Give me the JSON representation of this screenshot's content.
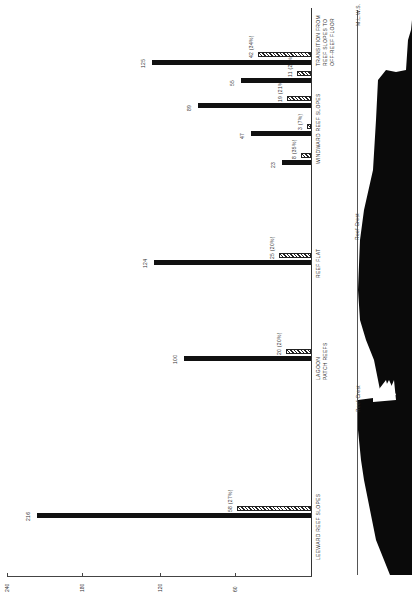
{
  "chart_data": {
    "type": "bar",
    "orientation": "horizontal (figure rotated 90°; values increase leftward)",
    "title": "",
    "xlabel": "",
    "ylabel": "",
    "axis_ticks": [
      "240",
      "180",
      "120",
      "60"
    ],
    "xlim": [
      0,
      240
    ],
    "grid": false,
    "categories": [
      "LEEWARD REEF SLOPES",
      "LAGOON PATCH REEFS",
      "REEF FLAT",
      "WINDWARD REEF SLOPES (a)",
      "WINDWARD REEF SLOPES (b)",
      "WINDWARD REEF SLOPES (c)",
      "WINDWARD REEF SLOPES (d)",
      "TRANSITION FROM REEF SLOPES TO OFF-REEF FLOOR"
    ],
    "series": [
      {
        "name": "total",
        "style": "solid",
        "values": [
          216,
          100,
          124,
          23,
          47,
          89,
          55,
          125
        ]
      },
      {
        "name": "subset",
        "style": "hatched",
        "values": [
          58,
          20,
          25,
          8,
          3,
          19,
          11,
          42
        ],
        "labels": [
          "58 (27%)",
          "20 (20%)",
          "25 (20%)",
          "8 (35%)",
          "3 (7%)",
          "19 (21%)",
          "11 (20%)",
          "42 (34%)"
        ]
      }
    ],
    "annotations": [
      "Reef Crest",
      "Reef Crest",
      "M.L.W.S."
    ]
  },
  "axis": {
    "ticks": [
      {
        "label": "240",
        "x": 7
      },
      {
        "label": "180",
        "x": 82
      },
      {
        "label": "120",
        "x": 160
      },
      {
        "label": "60",
        "x": 235
      }
    ]
  },
  "groups": [
    {
      "name": "LEEWARD REEF SLOPES",
      "label_lines": [
        "LEEWARD REEF SLOPES"
      ],
      "label_top": 560
    },
    {
      "name": "LAGOON PATCH REEFS",
      "label_lines": [
        "LAGOON",
        "PATCH REEFS"
      ],
      "label_top": 380
    },
    {
      "name": "REEF FLAT",
      "label_lines": [
        "REEF   FLAT"
      ],
      "label_top": 278
    },
    {
      "name": "WINDWARD REEF SLOPES",
      "label_lines": [
        "WINDWARD   REEF   SLOPES"
      ],
      "label_top": 164
    },
    {
      "name": "TRANSITION",
      "label_lines": [
        "TRANSITION  FROM",
        "REEF  SLOPES  TO",
        "OFF-REEF  FLOOR"
      ],
      "label_top": 66
    }
  ],
  "bars": [
    {
      "value": 216,
      "label": "216",
      "y": 513,
      "sub": 58,
      "sub_label": "58 (27%)",
      "sub_y": 506
    },
    {
      "value": 100,
      "label": "100",
      "y": 356,
      "sub": 20,
      "sub_label": "20 (20%)",
      "sub_y": 349
    },
    {
      "value": 124,
      "label": "124",
      "y": 260,
      "sub": 25,
      "sub_label": "25 (20%)",
      "sub_y": 253
    },
    {
      "value": 23,
      "label": "23",
      "y": 160,
      "sub": 8,
      "sub_label": "8 (35%)",
      "sub_y": 153
    },
    {
      "value": 47,
      "label": "47",
      "y": 131,
      "sub": 3,
      "sub_label": "3 (7%)",
      "sub_y": 124
    },
    {
      "value": 89,
      "label": "89",
      "y": 103,
      "sub": 19,
      "sub_label": "19 (21%)",
      "sub_y": 96
    },
    {
      "value": 55,
      "label": "55",
      "y": 78,
      "sub": 11,
      "sub_label": "11 (20%)",
      "sub_y": 71
    },
    {
      "value": 125,
      "label": "125",
      "y": 60,
      "sub": 42,
      "sub_label": "42 (34%)",
      "sub_y": 52
    }
  ],
  "profile": {
    "labels": {
      "crest_lower": "Reef Crest",
      "crest_upper": "Reef Crest",
      "mlws": "M.L.W.S."
    }
  },
  "colors": {
    "bar": "#111111",
    "hatch": "#222222",
    "background": "#ffffff"
  }
}
